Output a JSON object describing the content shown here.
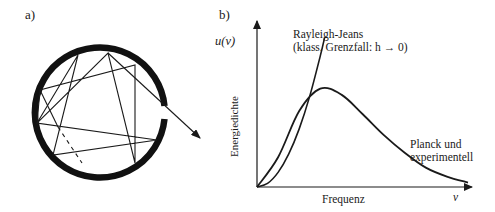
{
  "panels": {
    "a": {
      "label": "a)"
    },
    "b": {
      "label": "b)"
    }
  },
  "cavity": {
    "description": "Hohlraum mit kleiner Öffnung, Strahl wird mehrfach reflektiert und tritt aus",
    "wall_color": "#111111",
    "ray_color": "#1a1a1a"
  },
  "chart_data": {
    "type": "line",
    "title": "",
    "xlabel": "Frequenz",
    "xlabel_symbol": "ν",
    "ylabel": "Energiedichte",
    "ylabel_symbol": "u(ν)",
    "ticks": false,
    "grid": false,
    "series": [
      {
        "name": "Rayleigh-Jeans",
        "annotation_lines": [
          "Rayleigh-Jeans",
          "(klass. Grenzfall: h → 0)"
        ],
        "shape": "quadratic growth ~ ν²",
        "x": [
          0,
          0.05,
          0.1,
          0.15,
          0.2,
          0.25,
          0.3,
          0.32
        ],
        "y": [
          0,
          0.024,
          0.098,
          0.22,
          0.39,
          0.61,
          0.88,
          1.0
        ]
      },
      {
        "name": "Planck und experimentell",
        "annotation_lines": [
          "Planck und",
          "experimentell"
        ],
        "shape": "ν³/(e^(hν/kT)−1)",
        "x": [
          0,
          0.1,
          0.2,
          0.3,
          0.4,
          0.5,
          0.6,
          0.7,
          0.8,
          0.9,
          1.0
        ],
        "y": [
          0,
          0.2,
          0.51,
          0.66,
          0.62,
          0.49,
          0.35,
          0.23,
          0.13,
          0.07,
          0.03
        ]
      }
    ]
  }
}
